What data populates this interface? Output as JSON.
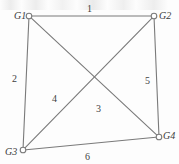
{
  "figure": {
    "background_color": "#fdfdfd",
    "line_color": "#7a7a7a",
    "text_color": "#3a3a3a"
  },
  "chart_data": {
    "type": "diagram",
    "subtype": "node-link-graph",
    "title": "",
    "directed": false,
    "nodes": [
      {
        "id": "G1",
        "label": "G1",
        "x": 29,
        "y": 16,
        "label_x": 14,
        "label_y": 11
      },
      {
        "id": "G2",
        "label": "G2",
        "x": 154,
        "y": 16,
        "label_x": 159,
        "label_y": 11
      },
      {
        "id": "G3",
        "label": "G3",
        "x": 23,
        "y": 150,
        "label_x": 5,
        "label_y": 147
      },
      {
        "id": "G4",
        "label": "G4",
        "x": 159,
        "y": 137,
        "label_x": 163,
        "label_y": 131
      }
    ],
    "edges": [
      {
        "id": "e1",
        "label": "1",
        "from": "G1",
        "to": "G2",
        "label_x": 87,
        "label_y": 4
      },
      {
        "id": "e2",
        "label": "2",
        "from": "G1",
        "to": "G3",
        "label_x": 12,
        "label_y": 74
      },
      {
        "id": "e3",
        "label": "3",
        "from": "G1",
        "to": "G4",
        "label_x": 96,
        "label_y": 104
      },
      {
        "id": "e4",
        "label": "4",
        "from": "G2",
        "to": "G3",
        "label_x": 52,
        "label_y": 94
      },
      {
        "id": "e5",
        "label": "5",
        "from": "G2",
        "to": "G4",
        "label_x": 145,
        "label_y": 76
      },
      {
        "id": "e6",
        "label": "6",
        "from": "G3",
        "to": "G4",
        "label_x": 85,
        "label_y": 152
      }
    ],
    "node_count": 4,
    "edge_count": 6,
    "node_marker": "open-circle"
  }
}
